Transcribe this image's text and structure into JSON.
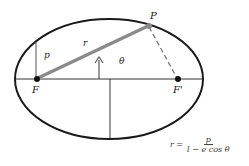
{
  "diagram": {
    "type": "ellipse-focus-polar",
    "labels": {
      "point": "P",
      "focus": "F",
      "other_focus": "F'",
      "radius": "r",
      "semi_latus": "p",
      "angle": "θ"
    },
    "formula": {
      "lhs": "r =",
      "numerator": "p",
      "denominator": "l − e cos θ"
    },
    "colors": {
      "ellipse": "#1a1a1a",
      "radius_line": "#8a8a8a",
      "dashed_line": "#777777",
      "axes": "#333333"
    }
  }
}
